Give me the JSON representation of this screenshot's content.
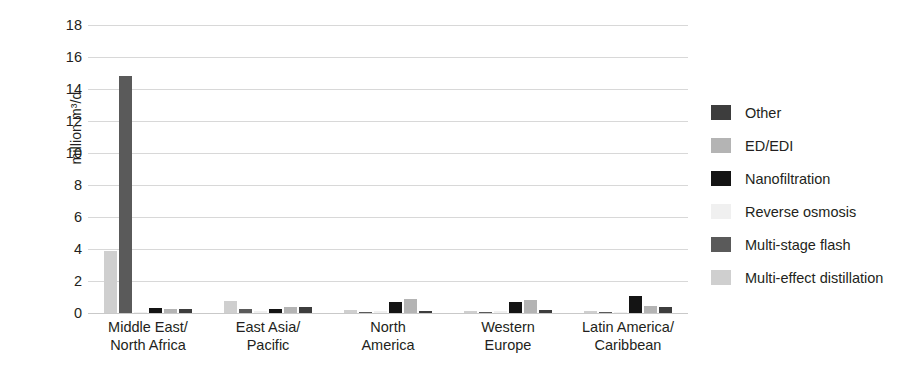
{
  "chart_data": {
    "type": "bar",
    "title": "",
    "xlabel": "",
    "ylabel": "million m³/d",
    "ylim": [
      0,
      18
    ],
    "ytick_step": 2,
    "yticks": [
      18,
      16,
      14,
      12,
      10,
      8,
      6,
      4,
      2,
      0
    ],
    "grid": true,
    "legend_position": "right",
    "categories": [
      "Middle East/\nNorth Africa",
      "East Asia/\nPacific",
      "North\nAmerica",
      "Western\nEurope",
      "Latin America/\nCaribbean"
    ],
    "series": [
      {
        "name": "Multi-effect distillation",
        "color": "#cfcfcf",
        "values": [
          3.9,
          0.75,
          0.2,
          0.15,
          0.1
        ]
      },
      {
        "name": "Multi-stage flash",
        "color": "#5a5a5a",
        "values": [
          14.8,
          0.25,
          0.05,
          0.05,
          0.05
        ]
      },
      {
        "name": "Reverse osmosis",
        "color": "#f0f0f0",
        "values": [
          0.05,
          0.1,
          0.1,
          0.1,
          0.05
        ]
      },
      {
        "name": "Nanofiltration",
        "color": "#141414",
        "values": [
          0.3,
          0.25,
          0.7,
          0.7,
          1.05
        ]
      },
      {
        "name": "ED/EDI",
        "color": "#b4b4b4",
        "values": [
          0.25,
          0.4,
          0.9,
          0.8,
          0.45
        ]
      },
      {
        "name": "Other",
        "color": "#3d3d3d",
        "values": [
          0.25,
          0.35,
          0.15,
          0.2,
          0.35
        ]
      }
    ]
  },
  "legend": {
    "items": [
      {
        "label": "Other",
        "color": "#3d3d3d"
      },
      {
        "label": "ED/EDI",
        "color": "#b4b4b4"
      },
      {
        "label": "Nanofiltration",
        "color": "#141414"
      },
      {
        "label": "Reverse osmosis",
        "color": "#f0f0f0"
      },
      {
        "label": "Multi-stage flash",
        "color": "#5a5a5a"
      },
      {
        "label": "Multi-effect distillation",
        "color": "#cfcfcf"
      }
    ]
  }
}
